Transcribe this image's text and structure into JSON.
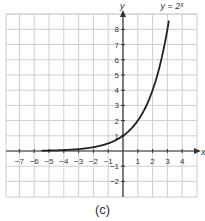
{
  "chart_data": {
    "type": "line",
    "title": "",
    "caption": "(c)",
    "xlabel": "x",
    "ylabel": "y",
    "xlim": [
      -7.7,
      4.9
    ],
    "ylim": [
      -2.9,
      9.2
    ],
    "grid": true,
    "x_ticks": [
      -7,
      -6,
      -5,
      -4,
      -3,
      -2,
      -1,
      1,
      2,
      3,
      4
    ],
    "y_ticks": [
      -2,
      -1,
      1,
      2,
      3,
      4,
      5,
      6,
      7,
      8
    ],
    "series": [
      {
        "name": "y = 2^x",
        "label": "y = 2ˣ",
        "function": "2^x",
        "x": [
          -5.5,
          -5,
          -4,
          -3,
          -2,
          -1,
          0,
          1,
          2,
          3,
          3.1
        ],
        "y": [
          0.022,
          0.031,
          0.0625,
          0.125,
          0.25,
          0.5,
          1,
          2,
          4,
          8,
          8.57
        ]
      }
    ]
  },
  "labels": {
    "x_axis": "x",
    "y_axis": "y",
    "curve": "y = 2ˣ",
    "caption": "(c)"
  }
}
